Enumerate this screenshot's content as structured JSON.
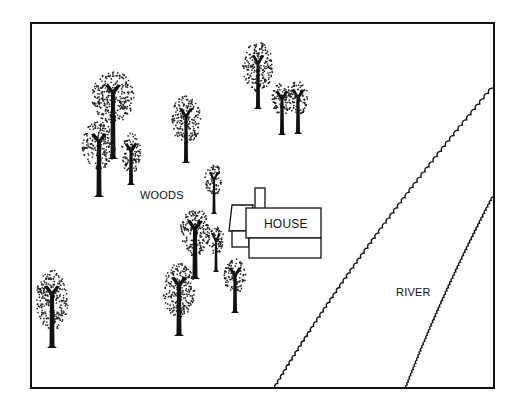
{
  "diagram": {
    "type": "map-sketch",
    "frame": {
      "x": 31,
      "y": 23,
      "width": 463,
      "height": 365,
      "stroke": "#111111"
    },
    "labels": {
      "woods": {
        "text": "WOODS",
        "x": 140,
        "y": 189
      },
      "house": {
        "text": "HOUSE",
        "x": 264,
        "y": 217
      },
      "river": {
        "text": "RIVER",
        "x": 396,
        "y": 286
      }
    },
    "house": {
      "chimney": {
        "x": 255,
        "y": 188,
        "w": 10,
        "h": 21
      },
      "main_roof": {
        "x": 246,
        "y": 208,
        "w": 75,
        "h": 30
      },
      "main_wall": {
        "x": 249,
        "y": 238,
        "w": 72,
        "h": 20
      },
      "wing_roof": {
        "x": 229,
        "y": 205,
        "w": 20,
        "h": 26
      },
      "wing_wall": {
        "x": 232,
        "y": 231,
        "w": 17,
        "h": 16
      }
    },
    "river": {
      "left_bank": {
        "start": [
          275,
          388
        ],
        "end": [
          493,
          88
        ]
      },
      "right_bank": {
        "start": [
          406,
          388
        ],
        "end": [
          493,
          197
        ]
      }
    },
    "trees": [
      {
        "cx": 113,
        "cy": 97,
        "rx": 21,
        "ry": 26,
        "base": 157,
        "trunk_w": 5
      },
      {
        "cx": 99,
        "cy": 145,
        "rx": 17,
        "ry": 24,
        "base": 195,
        "trunk_w": 5
      },
      {
        "cx": 131,
        "cy": 153,
        "rx": 10,
        "ry": 20,
        "base": 183,
        "trunk_w": 4
      },
      {
        "cx": 186,
        "cy": 120,
        "rx": 15,
        "ry": 24,
        "base": 161,
        "trunk_w": 4
      },
      {
        "cx": 258,
        "cy": 67,
        "rx": 15,
        "ry": 25,
        "base": 107,
        "trunk_w": 4
      },
      {
        "cx": 282,
        "cy": 99,
        "rx": 10,
        "ry": 16,
        "base": 133,
        "trunk_w": 4
      },
      {
        "cx": 298,
        "cy": 98,
        "rx": 10,
        "ry": 17,
        "base": 132,
        "trunk_w": 4
      },
      {
        "cx": 214,
        "cy": 180,
        "rx": 9,
        "ry": 16,
        "base": 212,
        "trunk_w": 3
      },
      {
        "cx": 195,
        "cy": 232,
        "rx": 15,
        "ry": 24,
        "base": 277,
        "trunk_w": 5
      },
      {
        "cx": 216,
        "cy": 240,
        "rx": 8,
        "ry": 14,
        "base": 270,
        "trunk_w": 3
      },
      {
        "cx": 235,
        "cy": 276,
        "rx": 11,
        "ry": 17,
        "base": 311,
        "trunk_w": 4
      },
      {
        "cx": 179,
        "cy": 290,
        "rx": 16,
        "ry": 27,
        "base": 334,
        "trunk_w": 5
      },
      {
        "cx": 52,
        "cy": 300,
        "rx": 16,
        "ry": 30,
        "base": 346,
        "trunk_w": 5
      }
    ]
  }
}
